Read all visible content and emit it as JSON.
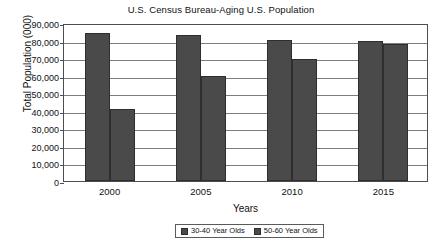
{
  "chart_data": {
    "type": "bar",
    "title": "U.S. Census Bureau-Aging U.S. Population",
    "xlabel": "Years",
    "ylabel": "Total Population (000)",
    "categories": [
      "2000",
      "2005",
      "2010",
      "2015"
    ],
    "series": [
      {
        "name": "30-40 Year Olds",
        "values": [
          84500,
          83000,
          80500,
          79500
        ],
        "color": "#4a4a4a"
      },
      {
        "name": "50-60 Year Olds",
        "values": [
          41000,
          60000,
          69500,
          78000
        ],
        "color": "#4a4a4a"
      }
    ],
    "ylim": [
      0,
      90000
    ],
    "ytick_step": 10000,
    "ytick_labels": [
      "0",
      "10,000",
      "20,000",
      "30,000",
      "40,000",
      "50,000",
      "60,000",
      "70,000",
      "80,000",
      "90,000"
    ],
    "grid": "horizontal",
    "legend_position": "bottom-center"
  }
}
